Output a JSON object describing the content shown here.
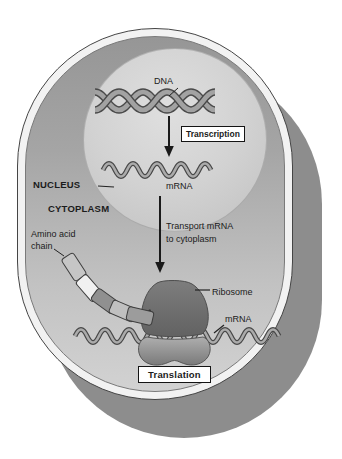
{
  "labels": {
    "dna": "DNA",
    "transcription": "Transcription",
    "mrna_nucleus": "mRNA",
    "nucleus": "NUCLEUS",
    "cytoplasm": "CYTOPLASM",
    "transport": {
      "line1": "Transport mRNA",
      "line2": "to cytoplasm"
    },
    "amino_acid_chain": {
      "line1": "Amino acid",
      "line2": "chain"
    },
    "ribosome": "Ribosome",
    "mrna_cytoplasm": "mRNA",
    "translation": "Translation"
  },
  "colors": {
    "background": "#ffffff",
    "cell_wall": "#f2f2f2",
    "cell_shadow": "#8d8d8d",
    "cytoplasm_top": "#969696",
    "cytoplasm_bottom": "#d2d2d2",
    "nucleus_center": "#dfdfdf",
    "nucleus_edge": "#c0c0c0",
    "ribosome_large_subunit": "#6d6d6d",
    "ribosome_small_subunit_top": "#acacac",
    "ribosome_small_subunit_bottom": "#7c7c7c",
    "strand_fill": "#a2a2a2",
    "strand_outline": "#4a4a4a",
    "arrow": "#1a1a1a",
    "text": "#1b1b1b"
  }
}
